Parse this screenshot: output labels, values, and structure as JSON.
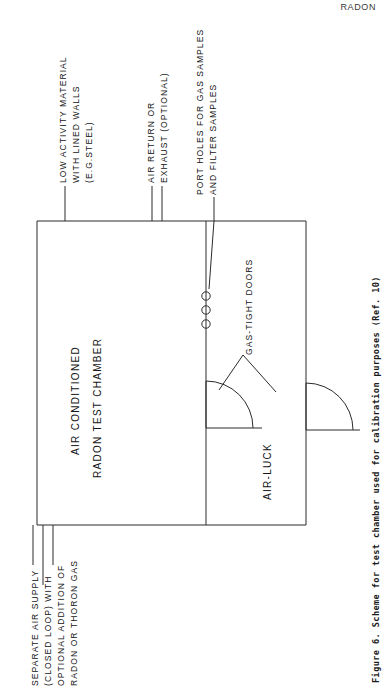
{
  "page": {
    "running_head": "RADON",
    "caption": "Figure 6.  Scheme for test chamber used for calibration purposes (Ref. 10)"
  },
  "diagram": {
    "callouts": [
      {
        "id": "wall-material",
        "lines": [
          "LOW ACTIVITY MATERIAL",
          "WITH LINED WALLS",
          "(E.G.STEEL)"
        ]
      },
      {
        "id": "air-return",
        "lines": [
          "AIR RETURN OR",
          "EXHAUST (OPTIONAL)"
        ]
      },
      {
        "id": "port-holes",
        "lines": [
          "PORT HOLES FOR GAS SAMPLES",
          "AND FILTER SAMPLES"
        ]
      },
      {
        "id": "air-supply",
        "lines": [
          "SEPARATE AIR SUPPLY",
          "(CLOSED LOOP) WITH",
          "OPTIONAL ADDITION OF",
          "RADON OR THORON GAS"
        ]
      }
    ],
    "interior_labels": [
      {
        "id": "chamber",
        "lines": [
          "AIR CONDITIONED",
          "RADON TEST CHAMBER"
        ]
      },
      {
        "id": "air-lock",
        "lines": [
          "AIR-LUCK"
        ]
      },
      {
        "id": "gas-tight-doors",
        "lines": [
          "GAS-TIGHT DOORS"
        ]
      }
    ],
    "port_hole_count": 3,
    "stroke_color": "#2a2a2a",
    "background_color": "#ffffff"
  }
}
